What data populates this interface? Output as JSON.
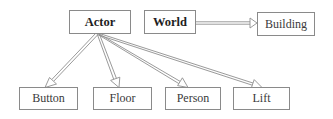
{
  "diagram": {
    "type": "class-hierarchy",
    "colors": {
      "line": "#8a8a8a",
      "text": "#3a3a3a",
      "background": "#ffffff"
    },
    "nodes": [
      {
        "id": "actor",
        "label": "Actor",
        "bold": true
      },
      {
        "id": "world",
        "label": "World",
        "bold": true
      },
      {
        "id": "building",
        "label": "Building",
        "bold": false
      },
      {
        "id": "button",
        "label": "Button",
        "bold": false
      },
      {
        "id": "floor",
        "label": "Floor",
        "bold": false
      },
      {
        "id": "person",
        "label": "Person",
        "bold": false
      },
      {
        "id": "lift",
        "label": "Lift",
        "bold": false
      }
    ],
    "edges": [
      {
        "from": "actor",
        "to": "button",
        "style": "hollow-double-arrow"
      },
      {
        "from": "actor",
        "to": "floor",
        "style": "hollow-double-arrow"
      },
      {
        "from": "actor",
        "to": "person",
        "style": "hollow-double-arrow"
      },
      {
        "from": "actor",
        "to": "lift",
        "style": "hollow-double-arrow"
      },
      {
        "from": "world",
        "to": "building",
        "style": "hollow-double-arrow"
      }
    ]
  }
}
